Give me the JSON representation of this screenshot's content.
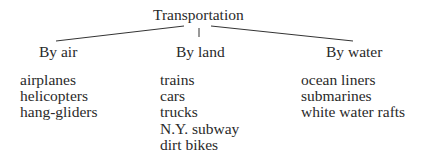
{
  "diagram": {
    "root": "Transportation",
    "branches": [
      {
        "label": "By air",
        "items": [
          "airplanes",
          "helicopters",
          "hang-gliders"
        ]
      },
      {
        "label": "By land",
        "items": [
          "trains",
          "cars",
          "trucks",
          "N.Y. subway",
          "dirt bikes"
        ]
      },
      {
        "label": "By water",
        "items": [
          "ocean liners",
          "submarines",
          "white water rafts"
        ]
      }
    ]
  }
}
